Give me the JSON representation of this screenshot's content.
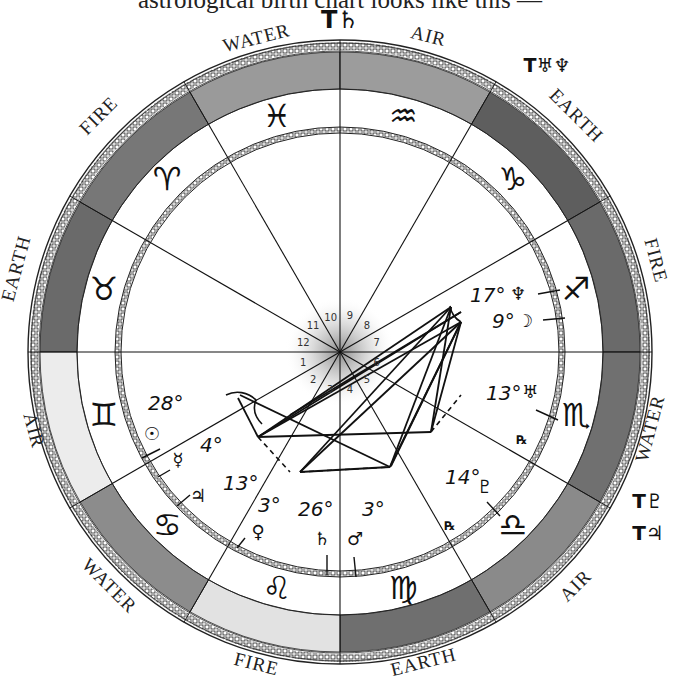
{
  "caption": "astrological birth chart looks like this —",
  "chart": {
    "center": [
      340,
      352
    ],
    "outer_radius": 312,
    "band_inner_radius": 263,
    "zodiac_inner_radius": 228,
    "inner_ring_radius": 222
  },
  "signs": [
    {
      "name": "taurus",
      "glyph": "♉",
      "element": "EARTH",
      "shade": "#6a6a6a",
      "start_deg": 150
    },
    {
      "name": "aries",
      "glyph": "♈",
      "element": "FIRE",
      "shade": "#777777",
      "start_deg": 120
    },
    {
      "name": "pisces",
      "glyph": "♓",
      "element": "WATER",
      "shade": "#9a9a9a",
      "start_deg": 90
    },
    {
      "name": "aquarius",
      "glyph": "♒",
      "element": "AIR",
      "shade": "#9c9c9c",
      "start_deg": 60
    },
    {
      "name": "capricorn",
      "glyph": "♑",
      "element": "EARTH",
      "shade": "#5e5e5e",
      "start_deg": 30
    },
    {
      "name": "sagittarius",
      "glyph": "♐",
      "element": "FIRE",
      "shade": "#6a6a6a",
      "start_deg": 0
    },
    {
      "name": "scorpio",
      "glyph": "♏",
      "element": "WATER",
      "shade": "#707070",
      "start_deg": -30
    },
    {
      "name": "libra",
      "glyph": "♎",
      "element": "AIR",
      "shade": "#8a8a8a",
      "start_deg": -60
    },
    {
      "name": "virgo",
      "glyph": "♍",
      "element": "EARTH",
      "shade": "#6f6f6f",
      "start_deg": -90
    },
    {
      "name": "leo",
      "glyph": "♌",
      "element": "FIRE",
      "shade": "#e2e2e2",
      "start_deg": -120
    },
    {
      "name": "cancer",
      "glyph": "♋",
      "element": "WATER",
      "shade": "#8c8c8c",
      "start_deg": -150
    },
    {
      "name": "gemini",
      "glyph": "♊",
      "element": "AIR",
      "shade": "#ececec",
      "start_deg": -180
    }
  ],
  "element_labels": [
    {
      "text": "WATER",
      "x": 258,
      "y": 44,
      "rot": -14
    },
    {
      "text": "AIR",
      "x": 427,
      "y": 42,
      "rot": 14
    },
    {
      "text": "EARTH",
      "x": 572,
      "y": 120,
      "rot": 45
    },
    {
      "text": "FIRE",
      "x": 650,
      "y": 262,
      "rot": 75
    },
    {
      "text": "WATER",
      "x": 656,
      "y": 430,
      "rot": -75
    },
    {
      "text": "AIR",
      "x": 580,
      "y": 590,
      "rot": -45
    },
    {
      "text": "EARTH",
      "x": 425,
      "y": 668,
      "rot": -14
    },
    {
      "text": "FIRE",
      "x": 255,
      "y": 670,
      "rot": 14
    },
    {
      "text": "WATER",
      "x": 105,
      "y": 590,
      "rot": 45
    },
    {
      "text": "AIR",
      "x": 28,
      "y": 432,
      "rot": 75
    },
    {
      "text": "EARTH",
      "x": 22,
      "y": 270,
      "rot": -75
    },
    {
      "text": "FIRE",
      "x": 103,
      "y": 120,
      "rot": -45
    }
  ],
  "transit_labels": [
    {
      "text": "T♄",
      "x": 340,
      "y": 28,
      "size": 24
    },
    {
      "text": "T♅♆",
      "x": 547,
      "y": 72,
      "size": 19
    },
    {
      "text": "T♇",
      "x": 648,
      "y": 508,
      "size": 20
    },
    {
      "text": "T♃",
      "x": 648,
      "y": 540,
      "size": 20
    }
  ],
  "house_numbers": [
    "1",
    "2",
    "3",
    "4",
    "5",
    "6",
    "7",
    "8",
    "9",
    "10",
    "11",
    "12"
  ],
  "planets": [
    {
      "name": "neptune",
      "glyph": "♆",
      "degree": "17°",
      "dx": 470,
      "dy": 302,
      "gx": 518,
      "gy": 300,
      "tick": [
        538,
        294,
        560,
        290
      ]
    },
    {
      "name": "moon",
      "glyph": "☽",
      "degree": "9°",
      "dx": 492,
      "dy": 328,
      "gx": 525,
      "gy": 327,
      "tick": [
        543,
        320,
        565,
        318
      ]
    },
    {
      "name": "uranus",
      "glyph": "♅",
      "degree": "13°",
      "dx": 486,
      "dy": 400,
      "gx": 530,
      "gy": 398,
      "tick": [
        536,
        410,
        558,
        420
      ]
    },
    {
      "name": "uranus-retrograde",
      "glyph": "℞",
      "degree": "",
      "dx": 0,
      "dy": 0,
      "gx": 522,
      "gy": 444,
      "tick": null
    },
    {
      "name": "pluto",
      "glyph": "♇",
      "degree": "14°",
      "dx": 445,
      "dy": 484,
      "gx": 485,
      "gy": 493,
      "tick": [
        487,
        502,
        500,
        516
      ]
    },
    {
      "name": "pluto-retrograde",
      "glyph": "℞",
      "degree": "",
      "dx": 0,
      "dy": 0,
      "gx": 450,
      "gy": 530,
      "tick": null
    },
    {
      "name": "sun",
      "glyph": "☉",
      "degree": "28°",
      "dx": 148,
      "dy": 410,
      "gx": 152,
      "gy": 440,
      "tick": [
        142,
        458,
        160,
        449
      ]
    },
    {
      "name": "mercury",
      "glyph": "☿",
      "degree": "4°",
      "dx": 200,
      "dy": 452,
      "gx": 178,
      "gy": 466,
      "tick": [
        158,
        477,
        170,
        470
      ]
    },
    {
      "name": "jupiter",
      "glyph": "♃",
      "degree": "13°",
      "dx": 223,
      "dy": 490,
      "gx": 198,
      "gy": 502,
      "tick": [
        177,
        506,
        190,
        495
      ]
    },
    {
      "name": "venus",
      "glyph": "♀",
      "degree": "3°",
      "dx": 258,
      "dy": 512,
      "gx": 258,
      "gy": 538,
      "tick": [
        237,
        548,
        245,
        538
      ]
    },
    {
      "name": "saturn",
      "glyph": "♄",
      "degree": "26°",
      "dx": 298,
      "dy": 516,
      "gx": 322,
      "gy": 545,
      "tick": [
        327,
        555,
        327,
        575
      ]
    },
    {
      "name": "mars",
      "glyph": "♂",
      "degree": "3°",
      "dx": 362,
      "dy": 516,
      "gx": 355,
      "gy": 545,
      "tick": [
        354,
        557,
        356,
        577
      ]
    }
  ],
  "aspect_lines": [
    [
      451,
      307,
      258,
      437
    ],
    [
      451,
      307,
      300,
      472
    ],
    [
      451,
      307,
      431,
      432
    ],
    [
      461,
      322,
      258,
      437
    ],
    [
      461,
      322,
      300,
      472
    ],
    [
      461,
      322,
      431,
      432
    ],
    [
      461,
      322,
      390,
      467
    ],
    [
      451,
      307,
      390,
      467
    ],
    [
      258,
      437,
      461,
      312
    ],
    [
      258,
      437,
      431,
      432
    ],
    [
      240,
      395,
      390,
      467
    ],
    [
      300,
      472,
      390,
      467
    ],
    [
      258,
      437,
      238,
      398
    ],
    [
      391,
      466,
      461,
      322
    ],
    [
      290,
      415,
      461,
      312
    ]
  ],
  "aspect_dashed": [
    [
      300,
      472,
      390,
      467
    ],
    [
      431,
      432,
      461,
      395
    ],
    [
      258,
      437,
      290,
      472
    ]
  ],
  "aspect_curves": [
    "M226,395 C236,390 248,392 256,400 C252,410 256,418 262,424",
    "M450,306 C451,312 454,318 461,322"
  ]
}
